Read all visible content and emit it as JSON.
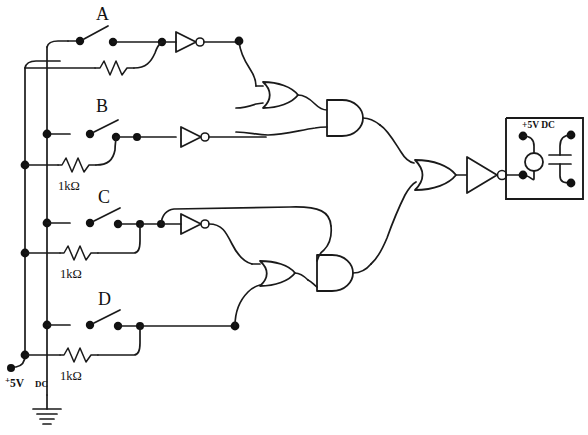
{
  "diagram": {
    "background_color": "#ffffff",
    "ink_color": "#1a1a1a",
    "width": 588,
    "height": 435
  },
  "inputs": [
    {
      "label": "A",
      "resistor_label": "",
      "has_inverter": true
    },
    {
      "label": "B",
      "resistor_label": "1kΩ",
      "has_inverter": true
    },
    {
      "label": "C",
      "resistor_label": "1kΩ",
      "has_inverter": true
    },
    {
      "label": "D",
      "resistor_label": "1kΩ",
      "has_inverter": false
    }
  ],
  "power": {
    "rail_label_prefix": "+",
    "rail_label": "5V",
    "rail_label_suffix": "DC",
    "rail_label_full": "+5V DC",
    "ground_symbol": "earth-ground"
  },
  "gates": [
    {
      "id": "or-upper",
      "type": "OR",
      "name": "upper-or-gate"
    },
    {
      "id": "and-upper",
      "type": "AND",
      "name": "upper-and-gate"
    },
    {
      "id": "or-lower",
      "type": "OR",
      "name": "lower-or-gate"
    },
    {
      "id": "and-lower",
      "type": "AND",
      "name": "lower-and-gate"
    },
    {
      "id": "or-final",
      "type": "OR",
      "name": "final-or-gate"
    },
    {
      "id": "not-output",
      "type": "NOT",
      "name": "output-inverter"
    },
    {
      "id": "not-a",
      "type": "NOT",
      "name": "inverter-a"
    },
    {
      "id": "not-b",
      "type": "NOT",
      "name": "inverter-b"
    },
    {
      "id": "not-c",
      "type": "NOT",
      "name": "inverter-c"
    }
  ],
  "output_module": {
    "supply_label": "+5V DC",
    "indicator": "lamp",
    "component": "capacitor",
    "terminals": 4
  }
}
